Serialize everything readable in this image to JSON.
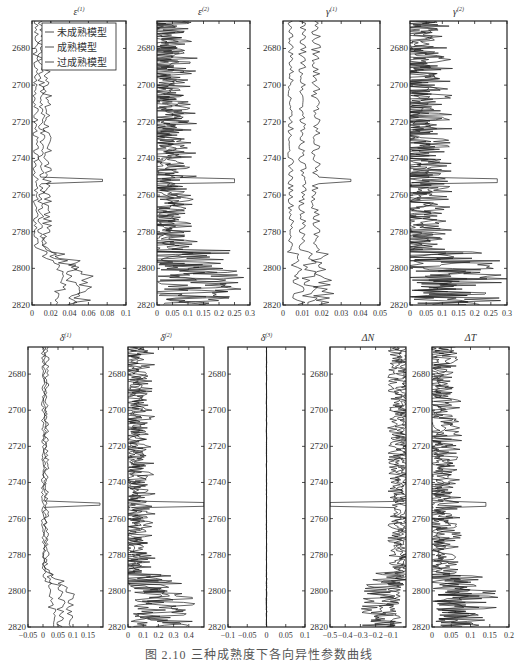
{
  "figure": {
    "caption": "图 2.10  三种成熟度下各向异性参数曲线",
    "legend": [
      "未成熟模型",
      "成熟模型",
      "过成熟模型"
    ],
    "depth_ticks": [
      2680,
      2700,
      2720,
      2740,
      2760,
      2780,
      2800,
      2820
    ],
    "depth_range": [
      2665,
      2820
    ]
  },
  "chart_data": [
    {
      "type": "line",
      "title": "ε(1)",
      "title_base": "ε",
      "title_sup": "(1)",
      "xlim": [
        0,
        0.1
      ],
      "xticks": [
        "0",
        "0.02",
        "0.04",
        "0.06",
        "0.08",
        "0.1"
      ],
      "ylabel": "Depth",
      "yinverted": true,
      "series": [
        {
          "name": "未成熟模型",
          "base": 0.004,
          "amp": 0.003,
          "deep_base": 0.03,
          "spike": 0.0
        },
        {
          "name": "成熟模型",
          "base": 0.01,
          "amp": 0.004,
          "deep_base": 0.045,
          "spike": 0.075
        },
        {
          "name": "过成熟模型",
          "base": 0.016,
          "amp": 0.005,
          "deep_base": 0.055,
          "spike": 0.0
        }
      ],
      "legend_position": "upper-left"
    },
    {
      "type": "line",
      "title": "ε(2)",
      "title_base": "ε",
      "title_sup": "(2)",
      "xlim": [
        0,
        0.3
      ],
      "xticks": [
        "0",
        "0.05",
        "0.1",
        "0.15",
        "0.2",
        "0.25",
        "0.3"
      ],
      "series": [
        {
          "name": "未成熟模型",
          "base": 0.02,
          "amp": 0.03,
          "deep_base": 0.08,
          "spike": 0.0
        },
        {
          "name": "成熟模型",
          "base": 0.04,
          "amp": 0.04,
          "deep_base": 0.11,
          "spike": 0.25
        },
        {
          "name": "过成熟模型",
          "base": 0.06,
          "amp": 0.05,
          "deep_base": 0.14,
          "spike": 0.0
        }
      ]
    },
    {
      "type": "line",
      "title": "γ(1)",
      "title_base": "γ",
      "title_sup": "(1)",
      "xlim": [
        0,
        0.05
      ],
      "xticks": [
        "0",
        "0.01",
        "0.02",
        "0.03",
        "0.04",
        "0.05"
      ],
      "series": [
        {
          "name": "未成熟模型",
          "base": 0.004,
          "amp": 0.0015,
          "deep_base": 0.008,
          "spike": 0.0
        },
        {
          "name": "成熟模型",
          "base": 0.01,
          "amp": 0.002,
          "deep_base": 0.014,
          "spike": 0.0
        },
        {
          "name": "过成熟模型",
          "base": 0.017,
          "amp": 0.0025,
          "deep_base": 0.021,
          "spike": 0.035
        }
      ]
    },
    {
      "type": "line",
      "title": "γ(2)",
      "title_base": "γ",
      "title_sup": "(2)",
      "xlim": [
        0,
        0.3
      ],
      "xticks": [
        "0",
        "0.05",
        "0.1",
        "0.15",
        "0.2",
        "0.25",
        "0.3"
      ],
      "series": [
        {
          "name": "未成熟模型",
          "base": 0.02,
          "amp": 0.03,
          "deep_base": 0.09,
          "spike": 0.0
        },
        {
          "name": "成熟模型",
          "base": 0.04,
          "amp": 0.04,
          "deep_base": 0.12,
          "spike": 0.27
        },
        {
          "name": "过成熟模型",
          "base": 0.06,
          "amp": 0.05,
          "deep_base": 0.15,
          "spike": 0.0
        }
      ]
    },
    {
      "type": "line",
      "title": "δ(1)",
      "title_base": "δ",
      "title_sup": "(1)",
      "xlim": [
        -0.05,
        0.2
      ],
      "xticks": [
        "−0.05",
        "0",
        "0.05",
        "0.1",
        "0.15"
      ],
      "series": [
        {
          "name": "未成熟模型",
          "base": 0.0,
          "amp": 0.006,
          "deep_base": 0.03,
          "spike": 0.0
        },
        {
          "name": "成熟模型",
          "base": 0.006,
          "amp": 0.007,
          "deep_base": 0.06,
          "spike": 0.19
        },
        {
          "name": "过成熟模型",
          "base": 0.012,
          "amp": 0.008,
          "deep_base": 0.09,
          "spike": 0.0
        }
      ]
    },
    {
      "type": "line",
      "title": "δ(2)",
      "title_base": "δ",
      "title_sup": "(2)",
      "xlim": [
        0,
        0.5
      ],
      "xticks": [
        "0",
        "0.1",
        "0.2",
        "0.3",
        "0.4"
      ],
      "series": [
        {
          "name": "未成熟模型",
          "base": 0.03,
          "amp": 0.04,
          "deep_base": 0.15,
          "spike": 0.0
        },
        {
          "name": "成熟模型",
          "base": 0.06,
          "amp": 0.05,
          "deep_base": 0.2,
          "spike": 0.5
        },
        {
          "name": "过成熟模型",
          "base": 0.09,
          "amp": 0.06,
          "deep_base": 0.25,
          "spike": 0.0
        }
      ]
    },
    {
      "type": "line",
      "title": "δ(3)",
      "title_base": "δ",
      "title_sup": "(3)",
      "xlim": [
        -0.1,
        0.1
      ],
      "xticks": [
        "−0.1",
        "−0.05",
        "0",
        "0.05",
        "0.1"
      ],
      "series": [
        {
          "name": "未成熟模型",
          "base": 0.0,
          "amp": 0.0003,
          "deep_base": 0.0,
          "spike": 0.0
        },
        {
          "name": "成熟模型",
          "base": 0.0,
          "amp": 0.0003,
          "deep_base": 0.0,
          "spike": 0.0
        },
        {
          "name": "过成熟模型",
          "base": 0.0,
          "amp": 0.0003,
          "deep_base": 0.0,
          "spike": 0.0
        }
      ]
    },
    {
      "type": "line",
      "title": "ΔN",
      "title_base": "ΔN",
      "title_sup": "",
      "xlim": [
        -0.5,
        0.0
      ],
      "xticks": [
        "−0.5",
        "−0.4",
        "−0.3",
        "−0.2",
        "−0.1"
      ],
      "series": [
        {
          "name": "未成熟模型",
          "base": -0.01,
          "amp": 0.02,
          "deep_base": -0.09,
          "spike": 0.0
        },
        {
          "name": "成熟模型",
          "base": -0.04,
          "amp": 0.03,
          "deep_base": -0.14,
          "spike": -0.5
        },
        {
          "name": "过成熟模型",
          "base": -0.07,
          "amp": 0.035,
          "deep_base": -0.19,
          "spike": 0.0
        }
      ]
    },
    {
      "type": "line",
      "title": "ΔT",
      "title_base": "ΔT",
      "title_sup": "",
      "xlim": [
        0,
        0.2
      ],
      "xticks": [
        "0",
        "0.05",
        "0.1",
        "0.15",
        "0.2"
      ],
      "series": [
        {
          "name": "未成熟模型",
          "base": 0.01,
          "amp": 0.015,
          "deep_base": 0.05,
          "spike": 0.0
        },
        {
          "name": "成熟模型",
          "base": 0.025,
          "amp": 0.02,
          "deep_base": 0.07,
          "spike": 0.14
        },
        {
          "name": "过成熟模型",
          "base": 0.04,
          "amp": 0.025,
          "deep_base": 0.09,
          "spike": 0.0
        }
      ]
    }
  ]
}
